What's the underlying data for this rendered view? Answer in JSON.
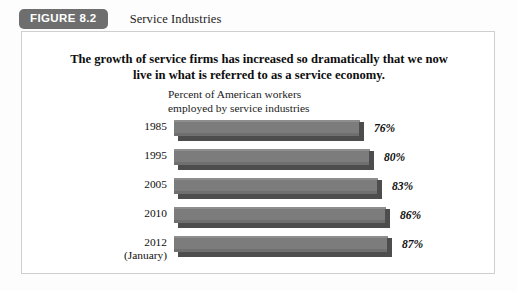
{
  "figure": {
    "badge_label": "FIGURE 8.2",
    "caption": "Service Industries",
    "headline_line1": "The growth of service firms has increased so dramatically that we now",
    "headline_line2": "live in what is referred to as a service economy.",
    "border_color": "#cfcfcf",
    "badge_color": "#6e6e6e"
  },
  "chart_data": {
    "type": "bar",
    "orientation": "horizontal",
    "title": "The growth of service firms has increased so dramatically that we now live in what is referred to as a service economy.",
    "subtitle_line1": "Percent of American workers",
    "subtitle_line2": "employed by service industries",
    "xlabel": "",
    "ylabel": "",
    "categories": [
      "1985",
      "1995",
      "2005",
      "2010",
      "2012 (January)"
    ],
    "values": [
      76,
      80,
      83,
      86,
      87
    ],
    "value_labels": [
      "76%",
      "80%",
      "83%",
      "86%",
      "87%"
    ],
    "xlim": [
      0,
      100
    ],
    "grid": false,
    "legend": "none",
    "bar_color": "#7c7c7c",
    "bar_shadow_color": "#4d4d4d",
    "rows": [
      {
        "label_line1": "1985",
        "label_line2": "",
        "value": 76,
        "value_label": "76%",
        "bar_px": 186
      },
      {
        "label_line1": "1995",
        "label_line2": "",
        "value": 80,
        "value_label": "80%",
        "bar_px": 196
      },
      {
        "label_line1": "2005",
        "label_line2": "",
        "value": 83,
        "value_label": "83%",
        "bar_px": 204
      },
      {
        "label_line1": "2010",
        "label_line2": "",
        "value": 86,
        "value_label": "86%",
        "bar_px": 212
      },
      {
        "label_line1": "2012",
        "label_line2": "(January)",
        "value": 87,
        "value_label": "87%",
        "bar_px": 214
      }
    ]
  }
}
